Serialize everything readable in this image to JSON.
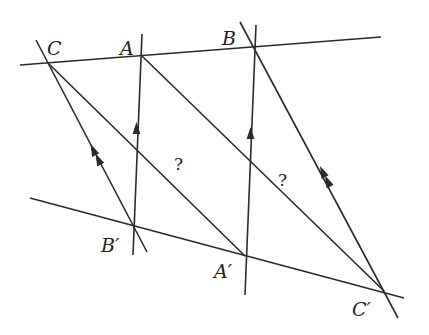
{
  "diagram": {
    "type": "geometry-construction",
    "stroke_color": "#2a2a2a",
    "points": {
      "C": {
        "label": "C",
        "x": 48,
        "y": 63
      },
      "A": {
        "label": "A",
        "x": 142,
        "y": 56
      },
      "B": {
        "label": "B",
        "x": 254,
        "y": 47
      },
      "B_prime": {
        "label": "B′",
        "x": 134,
        "y": 226
      },
      "A_prime": {
        "label": "A′",
        "x": 245,
        "y": 256
      },
      "C_prime": {
        "label": "C′",
        "x": 384,
        "y": 291
      }
    },
    "labels": {
      "C": "C",
      "A": "A",
      "B": "B",
      "B_prime": "B′",
      "A_prime": "A′",
      "C_prime": "C′",
      "question_1": "?",
      "question_2": "?"
    },
    "lines": [
      {
        "id": "top-line",
        "through": [
          "C",
          "A",
          "B"
        ]
      },
      {
        "id": "bottom-line",
        "through": [
          "B′",
          "A′",
          "C′"
        ]
      },
      {
        "id": "line-A-Bprime",
        "through": [
          "A",
          "B′"
        ],
        "arrow": "single"
      },
      {
        "id": "line-B-Aprime",
        "through": [
          "B",
          "A′"
        ],
        "arrow": "single"
      },
      {
        "id": "line-C-Bprime",
        "through": [
          "C",
          "B′"
        ],
        "arrow": "double"
      },
      {
        "id": "line-B-Cprime",
        "through": [
          "B",
          "C′"
        ],
        "arrow": "double"
      },
      {
        "id": "line-C-Aprime",
        "through": [
          "C",
          "A′"
        ],
        "marker": "?"
      },
      {
        "id": "line-A-Cprime",
        "through": [
          "A",
          "C′"
        ],
        "marker": "?"
      }
    ]
  }
}
